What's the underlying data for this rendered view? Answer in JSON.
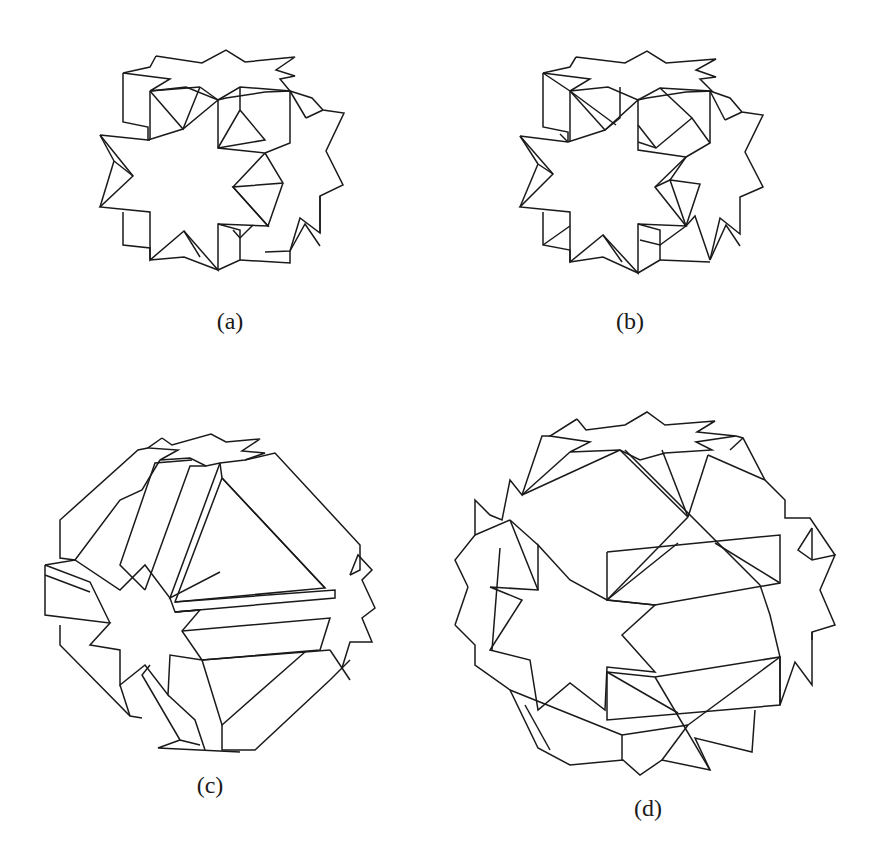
{
  "figure": {
    "panels": [
      {
        "id": "a",
        "label": "(a)",
        "description": "polyhedral compound with octagram faces, cube-like view"
      },
      {
        "id": "b",
        "label": "(b)",
        "description": "polyhedral compound with octagram faces, additional triangulated edges"
      },
      {
        "id": "c",
        "label": "(c)",
        "description": "rounded polyhedron with prism bands, triangular faces and octagram faces"
      },
      {
        "id": "d",
        "label": "(d)",
        "description": "rounded polyhedron with octagram faces and intersecting square/triangular faces"
      }
    ],
    "line_color": "#1a1a1a",
    "background": "#ffffff"
  }
}
